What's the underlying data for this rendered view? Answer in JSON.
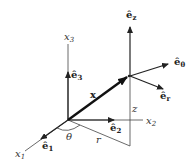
{
  "diagram": {
    "title": "",
    "type": "cylindrical coordinate basis vectors",
    "labels": {
      "x1": {
        "base": "x",
        "sub": "1"
      },
      "x2": {
        "base": "x",
        "sub": "2"
      },
      "x3": {
        "base": "x",
        "sub": "3"
      },
      "e1": {
        "base": "ê",
        "sub": "1"
      },
      "e2": {
        "base": "ê",
        "sub": "2"
      },
      "e3": {
        "base": "ê",
        "sub": "3"
      },
      "ez": {
        "base": "ê",
        "sub": "z"
      },
      "etheta": {
        "base": "ê",
        "sub": "θ"
      },
      "er": {
        "base": "ê",
        "sub": "r"
      },
      "x_vec": "x",
      "theta": "θ",
      "r": "r",
      "z": "z"
    },
    "colors": {
      "stroke": "#222222",
      "background": "#ffffff"
    }
  }
}
